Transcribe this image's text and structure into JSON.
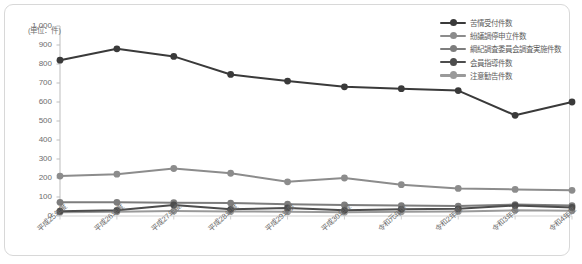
{
  "chart_data": {
    "type": "line",
    "title": "",
    "subtitle": "",
    "unit_label": "(単位：件)",
    "xlabel": "",
    "ylabel": "",
    "ylim": [
      0,
      1000
    ],
    "ytick_step": 100,
    "grid": false,
    "legend_position": "top-right",
    "categories": [
      "平成25年度",
      "平成26年度",
      "平成27年度",
      "平成28年度",
      "平成29年度",
      "平成30年度",
      "令和元年度",
      "令和2年度",
      "令和3年度",
      "令和4年度"
    ],
    "ytick_labels": [
      "0",
      "100",
      "200",
      "300",
      "400",
      "500",
      "600",
      "700",
      "800",
      "900",
      "1,000"
    ],
    "ytick_values": [
      0,
      100,
      200,
      300,
      400,
      500,
      600,
      700,
      800,
      900,
      1000
    ],
    "series": [
      {
        "name": "苦情受付件数",
        "color": "#3a3a3a",
        "values": [
          820,
          880,
          840,
          745,
          710,
          680,
          670,
          660,
          530,
          600
        ]
      },
      {
        "name": "紛議調停申立件数",
        "color": "#8c8c8c",
        "values": [
          210,
          220,
          250,
          225,
          180,
          200,
          165,
          145,
          140,
          135
        ]
      },
      {
        "name": "綱紀調査委員会調査実施件数",
        "color": "#7d7d7d",
        "values": [
          72,
          72,
          70,
          68,
          62,
          58,
          55,
          52,
          60,
          55
        ]
      },
      {
        "name": "会員指導件数",
        "color": "#4d4d4d",
        "values": [
          25,
          30,
          58,
          35,
          42,
          30,
          35,
          38,
          55,
          45
        ]
      },
      {
        "name": "注意勧告件数",
        "color": "#9a9a9a",
        "values": [
          20,
          22,
          26,
          24,
          22,
          20,
          22,
          24,
          30,
          28
        ]
      }
    ]
  }
}
